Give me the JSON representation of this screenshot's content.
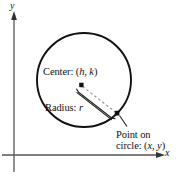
{
  "figure": {
    "type": "geometry-diagram",
    "background_color": "#ffffff",
    "stroke_color": "#111111",
    "axis_color": "#555555",
    "dashed_color": "#9a9a9a"
  },
  "axes": {
    "y_label": "y",
    "x_label": "x",
    "origin": {
      "x": 14,
      "y": 155
    },
    "y_axis": {
      "x": 14,
      "top": 14,
      "bottom": 172,
      "arrow": "up"
    },
    "x_axis": {
      "y": 155,
      "left": 2,
      "right": 163,
      "arrow": "right"
    }
  },
  "circle": {
    "center_px": {
      "x": 84,
      "y": 80
    },
    "radius_px": 47,
    "stroke_width": 1.9
  },
  "labels": {
    "center": {
      "prefix": "Center: (",
      "var1": "h",
      "sep": ", ",
      "var2": "k",
      "suffix": ")"
    },
    "radius": {
      "prefix": "Radius: ",
      "var": "r"
    },
    "point": {
      "line1": "Point on",
      "line2_prefix": "circle: (",
      "line2_var1": "x",
      "line2_sep": ", ",
      "line2_var2": "y",
      "line2_suffix": ")"
    }
  },
  "markers": {
    "center_dot": {
      "x": 81,
      "y": 85,
      "size": 4
    },
    "point_dot": {
      "x": 117,
      "y": 113,
      "size": 4
    },
    "radius_segment": {
      "x1": 82,
      "y1": 86,
      "x2": 117,
      "y2": 113,
      "style": "dashed"
    },
    "brace": {
      "from": {
        "x": 78,
        "y": 92
      },
      "to": {
        "x": 114,
        "y": 119
      }
    },
    "leader_line": {
      "x1": 121,
      "y1": 116,
      "x2": 128,
      "y2": 127
    }
  }
}
